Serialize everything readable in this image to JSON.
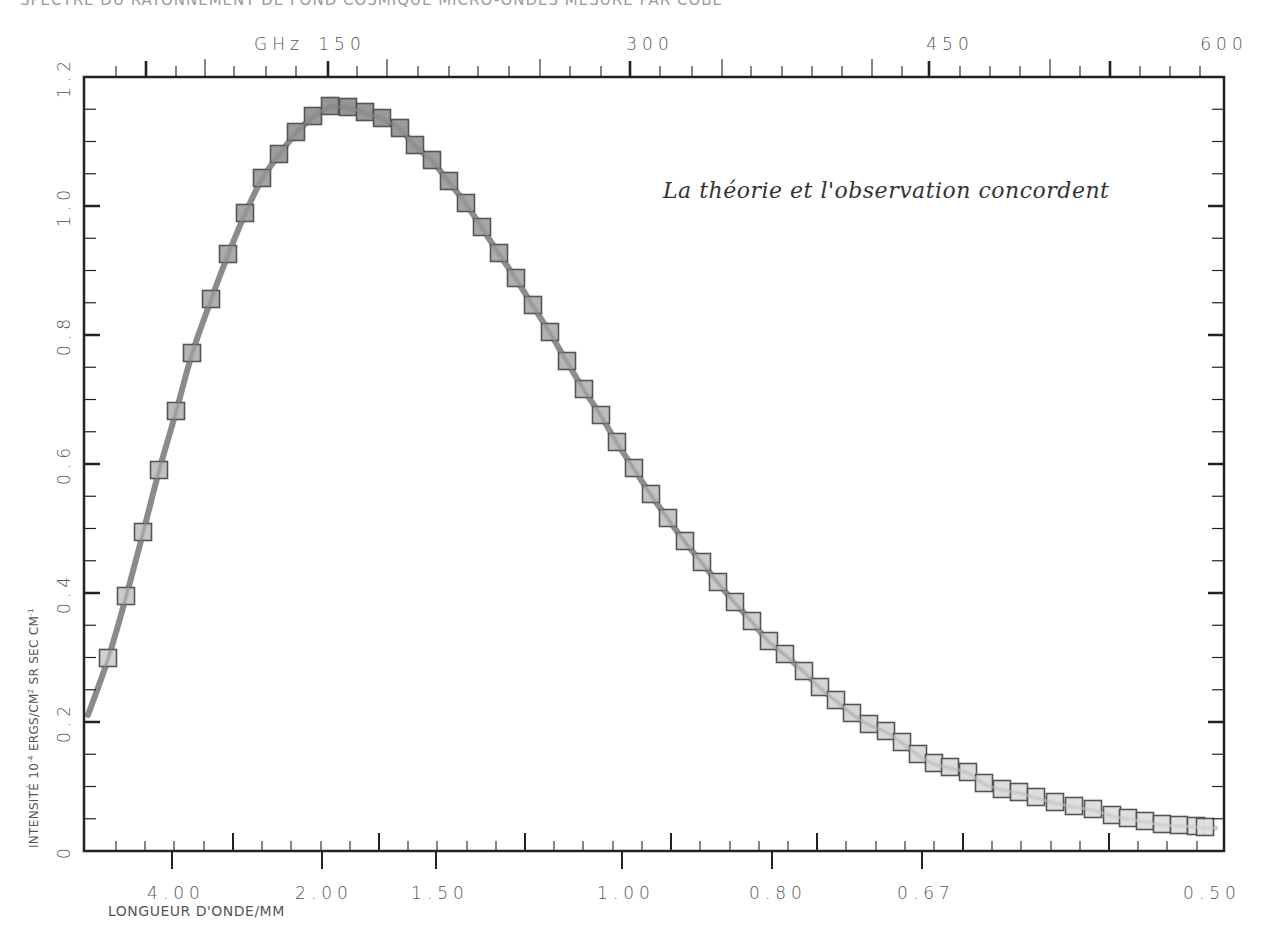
{
  "chart_data": {
    "type": "scatter",
    "title": "SPECTRE DU RAYONNEMENT DE FOND COSMIQUE MICRO-ONDES MESURÉ PAR COBE",
    "annotation": "La théorie et l'observation concordent",
    "xlabel": "LONGUEUR D'ONDE/MM",
    "x2label": "GHz",
    "ylabel": "INTENSITÉ 10-4 ERGS/CM2 SR SEC CM-1",
    "ylabel_parts": {
      "prefix": "INTENSITÉ 10",
      "exp1": "-4",
      "mid": " ERGS/CM",
      "exp2": "2",
      "suffix": " SR SEC CM",
      "exp3": "-1"
    },
    "ylim": [
      0,
      1.2
    ],
    "y_ticks": [
      "0",
      "0.2",
      "0.4",
      "0.6",
      "0.8",
      "1.0",
      "1.2"
    ],
    "x_bottom_ticks": [
      "4.00",
      "2.00",
      "1.50",
      "1.00",
      "0.80",
      "0.67",
      "0.50"
    ],
    "x_top_ticks": [
      "150",
      "300",
      "450",
      "600"
    ],
    "grid": false,
    "series": [
      {
        "name": "Observation COBE (points)",
        "marker": "square",
        "x_px": [
          108,
          126,
          143,
          159,
          176,
          192,
          211,
          228,
          245,
          262,
          279,
          296,
          313,
          330,
          348,
          365,
          382,
          400,
          415,
          432,
          449,
          466,
          482,
          499,
          516,
          533,
          550,
          567,
          584,
          601,
          617,
          634,
          651,
          668,
          685,
          702,
          718,
          735,
          752,
          769,
          785,
          804,
          820,
          836,
          852,
          869,
          886,
          902,
          918,
          934,
          950,
          968,
          984,
          1002,
          1019,
          1036,
          1055,
          1074,
          1093,
          1112,
          1128,
          1145,
          1162,
          1179,
          1196,
          1205
        ],
        "y_px": [
          658,
          596,
          532,
          470,
          411,
          353,
          299,
          254,
          213,
          178,
          154,
          132,
          116,
          106,
          107,
          112,
          118,
          128,
          145,
          160,
          181,
          203,
          227,
          253,
          278,
          305,
          332,
          361,
          389,
          415,
          442,
          468,
          494,
          518,
          541,
          562,
          582,
          602,
          621,
          641,
          654,
          671,
          687,
          700,
          713,
          724,
          731,
          742,
          754,
          763,
          767,
          772,
          783,
          789,
          792,
          797,
          802,
          806,
          809,
          815,
          818,
          821,
          824,
          825,
          826,
          827
        ],
        "values": [
          0.358,
          0.473,
          0.592,
          0.707,
          0.816,
          0.924,
          1.024,
          1.107,
          1.183,
          1.248,
          1.292,
          1.333,
          1.362,
          1.381,
          1.379,
          1.37,
          1.359,
          1.34,
          1.309,
          1.281,
          1.242,
          1.201,
          1.157,
          1.109,
          1.062,
          1.012,
          0.962,
          0.909,
          0.857,
          0.809,
          0.759,
          0.711,
          0.663,
          0.618,
          0.575,
          0.537,
          0.5,
          0.463,
          0.427,
          0.39,
          0.366,
          0.333,
          0.304,
          0.28,
          0.256,
          0.235,
          0.222,
          0.202,
          0.18,
          0.163,
          0.156,
          0.146,
          0.126,
          0.115,
          0.109,
          0.1,
          0.091,
          0.083,
          0.078,
          0.067,
          0.061,
          0.056,
          0.05,
          0.048,
          0.046,
          0.044
        ]
      },
      {
        "name": "Théorie (corps noir)",
        "line": true
      }
    ]
  },
  "colors": {
    "axis": "#222222",
    "curve_dark": "#8a8a8a",
    "curve_light": "#cfcfcf",
    "marker_fill_dark": "#8d8d8d",
    "marker_fill_light": "#dedede",
    "marker_edge": "#555555"
  }
}
